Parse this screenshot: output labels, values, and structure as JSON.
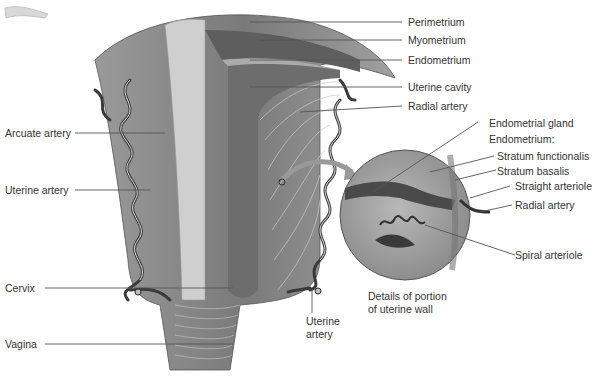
{
  "figure": {
    "left_labels": [
      {
        "id": "arcuate_artery",
        "text": "Arcuate artery"
      },
      {
        "id": "uterine_artery",
        "text": "Uterine artery"
      },
      {
        "id": "cervix",
        "text": "Cervix"
      },
      {
        "id": "vagina",
        "text": "Vagina"
      }
    ],
    "right_labels": [
      {
        "id": "perimetrium",
        "text": "Perimetrium"
      },
      {
        "id": "myometrium",
        "text": "Myometrium"
      },
      {
        "id": "endometrium",
        "text": "Endometrium"
      },
      {
        "id": "uterine_cavity",
        "text": "Uterine cavity"
      },
      {
        "id": "radial_artery",
        "text": "Radial artery"
      }
    ],
    "detail_labels": [
      {
        "id": "endometrial_gland",
        "text": "Endometrial gland"
      },
      {
        "id": "endometrium_heading",
        "text": "Endometrium:"
      },
      {
        "id": "stratum_functionalis",
        "text": "Stratum functionalis"
      },
      {
        "id": "stratum_basalis",
        "text": "Stratum basalis"
      },
      {
        "id": "straight_arteriole",
        "text": "Straight arteriole"
      },
      {
        "id": "radial_artery_detail",
        "text": "Radial artery"
      },
      {
        "id": "spiral_arteriole",
        "text": "Spiral arteriole"
      }
    ],
    "bottom_labels": {
      "uterine_artery_line1": "Uterine",
      "uterine_artery_line2": "artery",
      "detail_caption_line1": "Details of portion",
      "detail_caption_line2": "of uterine wall"
    },
    "colors": {
      "leader_line": "#555555",
      "label_text": "#333333",
      "tissue_dark": "#6b6b6b",
      "tissue_mid": "#8e8e8e",
      "tissue_light": "#c4c4c4",
      "vessel": "#3a3a3a"
    }
  }
}
